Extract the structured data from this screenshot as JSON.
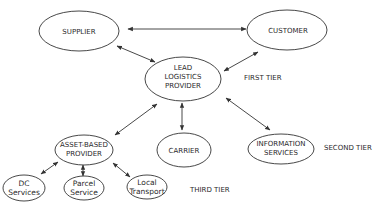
{
  "diagram": {
    "nodes": {
      "supplier": {
        "label": "SUPPLIER"
      },
      "customer": {
        "label": "CUSTOMER"
      },
      "lead": {
        "line1": "LEAD",
        "line2": "LOGISTICS",
        "line3": "PROVIDER"
      },
      "asset": {
        "line1": "ASSET-BASED",
        "line2": "PROVIDER"
      },
      "carrier": {
        "label": "CARRIER"
      },
      "info": {
        "line1": "INFORMATION",
        "line2": "SERVICES"
      },
      "dc": {
        "line1": "DC",
        "line2": "Services"
      },
      "parcel": {
        "line1": "Parcel",
        "line2": "Service"
      },
      "local": {
        "line1": "Local",
        "line2": "Transport"
      }
    },
    "tiers": {
      "first": "FIRST TIER",
      "second": "SECOND TIER",
      "third": "THIRD TIER"
    },
    "edges": [
      {
        "from": "supplier",
        "to": "customer",
        "type": "bidirectional"
      },
      {
        "from": "supplier",
        "to": "lead",
        "type": "bidirectional"
      },
      {
        "from": "customer",
        "to": "lead",
        "type": "bidirectional"
      },
      {
        "from": "lead",
        "to": "asset",
        "type": "bidirectional"
      },
      {
        "from": "lead",
        "to": "carrier",
        "type": "bidirectional"
      },
      {
        "from": "lead",
        "to": "info",
        "type": "bidirectional"
      },
      {
        "from": "asset",
        "to": "dc",
        "type": "bidirectional"
      },
      {
        "from": "asset",
        "to": "parcel",
        "type": "bidirectional"
      },
      {
        "from": "asset",
        "to": "local",
        "type": "bidirectional"
      }
    ],
    "colors": {
      "stroke": "#333333",
      "text": "#2a2a2a",
      "background": "#ffffff"
    }
  }
}
